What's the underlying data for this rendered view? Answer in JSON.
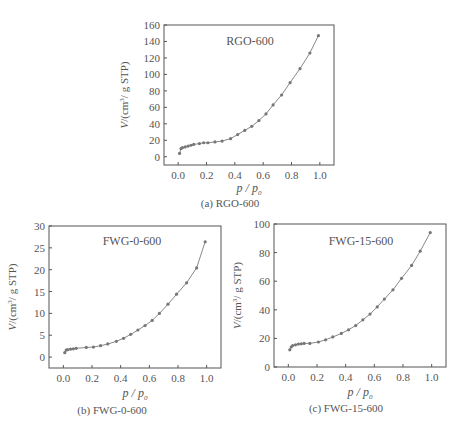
{
  "chart_data": [
    {
      "type": "scatter",
      "title": "RGO-600",
      "caption": "(a) RGO-600",
      "xlabel": "p/p0",
      "ylabel": "V/(cm³/g STP)",
      "xlim": [
        -0.1,
        1.1
      ],
      "ylim": [
        -10,
        160
      ],
      "xticks": [
        "0.0",
        "0.2",
        "0.4",
        "0.6",
        "0.8",
        "1.0"
      ],
      "yticks": [
        "0",
        "20",
        "40",
        "60",
        "80",
        "100",
        "120",
        "140",
        "160"
      ],
      "grid": false,
      "series": [
        {
          "name": "RGO-600",
          "x": [
            0.01,
            0.02,
            0.03,
            0.05,
            0.07,
            0.09,
            0.11,
            0.15,
            0.18,
            0.21,
            0.26,
            0.31,
            0.37,
            0.42,
            0.47,
            0.52,
            0.57,
            0.62,
            0.67,
            0.73,
            0.79,
            0.86,
            0.93,
            0.99
          ],
          "y": [
            4,
            10,
            11,
            12,
            13,
            14,
            15,
            16,
            17,
            17,
            18,
            19,
            22,
            27,
            32,
            37,
            44,
            52,
            63,
            75,
            90,
            107,
            126,
            147
          ]
        }
      ]
    },
    {
      "type": "scatter",
      "title": "FWG-0-600",
      "caption": "(b) FWG-0-600",
      "xlabel": "p/p0",
      "ylabel": "V/(cm³/g STP)",
      "xlim": [
        -0.1,
        1.1
      ],
      "ylim": [
        -2.5,
        30
      ],
      "xticks": [
        "0.0",
        "0.2",
        "0.4",
        "0.6",
        "0.8",
        "1.0"
      ],
      "yticks": [
        "0",
        "5",
        "10",
        "15",
        "20",
        "25",
        "30"
      ],
      "grid": false,
      "series": [
        {
          "name": "FWG-0-600",
          "x": [
            0.01,
            0.02,
            0.03,
            0.05,
            0.07,
            0.09,
            0.16,
            0.21,
            0.26,
            0.31,
            0.37,
            0.42,
            0.47,
            0.52,
            0.57,
            0.62,
            0.67,
            0.73,
            0.79,
            0.86,
            0.93,
            0.99
          ],
          "y": [
            1.0,
            1.6,
            1.7,
            1.8,
            1.9,
            2.0,
            2.2,
            2.3,
            2.6,
            3.0,
            3.6,
            4.3,
            5.2,
            6.2,
            7.2,
            8.4,
            10.0,
            12.1,
            14.4,
            17.0,
            20.4,
            26.4
          ]
        }
      ]
    },
    {
      "type": "scatter",
      "title": "FWG-15-600",
      "caption": "(c) FWG-15-600",
      "xlabel": "p/p0",
      "ylabel": "V/(cm³/g STP)",
      "xlim": [
        -0.1,
        1.1
      ],
      "ylim": [
        0,
        100
      ],
      "xticks": [
        "0.0",
        "0.2",
        "0.4",
        "0.6",
        "0.8",
        "1.0"
      ],
      "yticks": [
        "0",
        "20",
        "40",
        "60",
        "80",
        "100"
      ],
      "grid": false,
      "series": [
        {
          "name": "FWG-15-600",
          "x": [
            0.01,
            0.02,
            0.03,
            0.05,
            0.07,
            0.09,
            0.11,
            0.15,
            0.21,
            0.26,
            0.31,
            0.37,
            0.42,
            0.47,
            0.52,
            0.57,
            0.62,
            0.67,
            0.73,
            0.79,
            0.86,
            0.92,
            0.99
          ],
          "y": [
            12,
            14,
            15,
            15.5,
            16,
            16.2,
            16.5,
            16.5,
            17.5,
            19,
            21,
            23.5,
            26,
            29,
            33,
            37,
            42,
            47.5,
            54,
            62,
            71,
            81,
            94
          ]
        }
      ]
    }
  ],
  "style": {
    "axis_color": "#555555",
    "marker_color": "#777777",
    "line_color": "#888888",
    "background": "#ffffff"
  }
}
